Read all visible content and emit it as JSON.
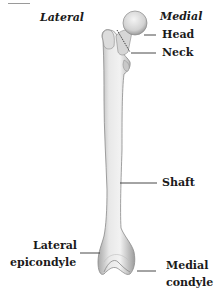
{
  "diagram": {
    "orientation": {
      "left": "Lateral",
      "right": "Medial"
    },
    "labels": {
      "head": "Head",
      "neck": "Neck",
      "shaft": "Shaft",
      "lateral_epicondyle_line1": "Lateral",
      "lateral_epicondyle_line2": "epicondyle",
      "medial_condyle_line1": "Medial",
      "medial_condyle_line2": "condyle"
    },
    "colors": {
      "bone_fill": "#e6e6e6",
      "bone_shade": "#b8b8b8",
      "leader_line": "#333333",
      "text": "#1a1a1a"
    }
  }
}
